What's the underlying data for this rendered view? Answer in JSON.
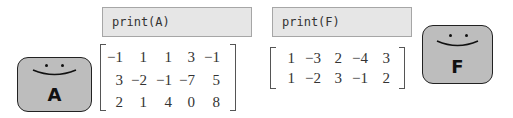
{
  "left": {
    "code": "print(A)",
    "matrix_name": "A",
    "matrix": [
      [
        "−1",
        "1",
        "1",
        "3",
        "−1"
      ],
      [
        "3",
        "−2",
        "−1",
        "−7",
        "5"
      ],
      [
        "2",
        "1",
        "4",
        "0",
        "8"
      ]
    ],
    "face_label": "A"
  },
  "right": {
    "code": "print(F)",
    "matrix_name": "F",
    "matrix": [
      [
        "1",
        "−3",
        "2",
        "−4",
        "3"
      ],
      [
        "1",
        "−2",
        "3",
        "−1",
        "2"
      ]
    ],
    "face_label": "F"
  },
  "colors": {
    "code_bg": "#e6e6e6",
    "face_bg": "#bdbdbd",
    "text": "#333333"
  }
}
